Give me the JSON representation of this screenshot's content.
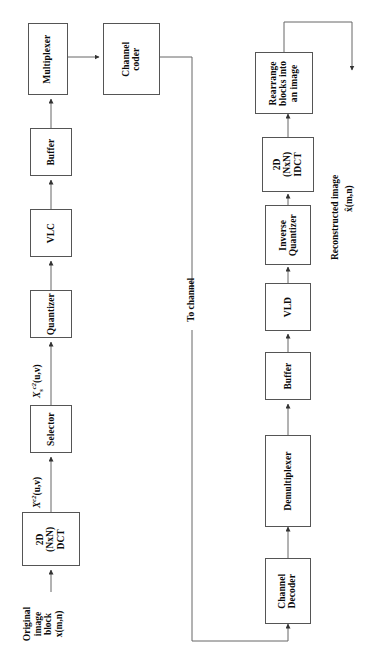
{
  "diagram": {
    "orientation": "rotated-90-ccw",
    "line_color": "#555555",
    "encoder": {
      "input_label": "Original\nimage\nblock\nx(m,n)",
      "input_label_lines": [
        "Original",
        "image",
        "block",
        "x(m,n)"
      ],
      "blocks": [
        {
          "id": "dct",
          "label_lines": [
            "2D",
            "(NxN)",
            "DCT"
          ]
        },
        {
          "id": "selector",
          "label_lines": [
            "Selector"
          ]
        },
        {
          "id": "quantizer",
          "label_lines": [
            "Quantizer"
          ]
        },
        {
          "id": "vlc",
          "label_lines": [
            "VLC"
          ]
        },
        {
          "id": "buffer",
          "label_lines": [
            "Buffer"
          ]
        },
        {
          "id": "multiplexer",
          "label_lines": [
            "Multiplexer"
          ]
        },
        {
          "id": "channel-coder",
          "label_lines": [
            "Channel",
            "coder"
          ]
        }
      ],
      "signal_labels": [
        {
          "id": "dct-out",
          "base": "X",
          "sup": "c2",
          "sub": "",
          "args": "(u,v)"
        },
        {
          "id": "selector-out",
          "base": "X",
          "sup": "c2",
          "sub": "s",
          "args": "(u,v)"
        }
      ]
    },
    "channel": {
      "label": "To channel"
    },
    "decoder": {
      "blocks": [
        {
          "id": "channel-decoder",
          "label_lines": [
            "Channel",
            "Decoder"
          ]
        },
        {
          "id": "demultiplexer",
          "label_lines": [
            "Demultiplexer"
          ]
        },
        {
          "id": "buffer",
          "label_lines": [
            "Buffer"
          ]
        },
        {
          "id": "vld",
          "label_lines": [
            "VLD"
          ]
        },
        {
          "id": "inverse-quantizer",
          "label_lines": [
            "Inverse",
            "Quantizer"
          ]
        },
        {
          "id": "idct",
          "label_lines": [
            "2D",
            "(NxN)",
            "IDCT"
          ]
        },
        {
          "id": "rearrange",
          "label_lines": [
            "Rearrange",
            "blocks into",
            "an image"
          ]
        }
      ],
      "output_label_lines": [
        "Reconstructed image",
        "x̂(m,n)"
      ]
    }
  }
}
